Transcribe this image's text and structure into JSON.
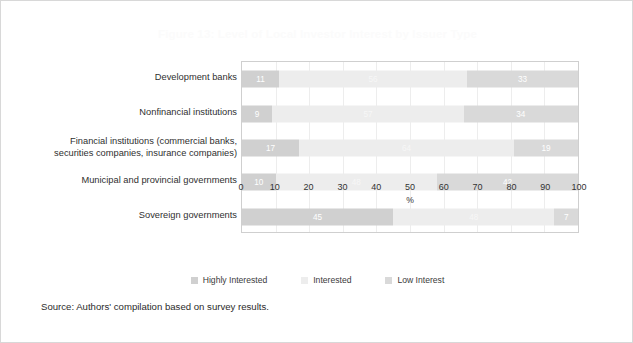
{
  "chart_data": {
    "type": "bar",
    "subtype": "stacked-horizontal-100pct",
    "title": "Figure 13: Level of Local Investor Interest by Issuer Type",
    "xlabel": "%",
    "ylabel": "",
    "xlim": [
      0,
      100
    ],
    "xticks": [
      "0",
      "10",
      "20",
      "30",
      "40",
      "50",
      "60",
      "70",
      "80",
      "90",
      "100"
    ],
    "grid": true,
    "legend_position": "bottom-center",
    "categories": [
      "Development banks",
      "Nonfinancial institutions",
      "Financial institutions (commercial banks, securities companies, insurance companies)",
      "Municipal and provincial governments",
      "Sovereign governments"
    ],
    "series": [
      {
        "name": "Highly Interested",
        "color": "#d0d0d0",
        "values": [
          11,
          9,
          17,
          10,
          45
        ]
      },
      {
        "name": "Interested",
        "color": "#ededed",
        "values": [
          56,
          57,
          64,
          48,
          48
        ]
      },
      {
        "name": "Low Interest",
        "color": "#d9d9d9",
        "values": [
          33,
          34,
          19,
          42,
          7
        ]
      }
    ]
  },
  "source": {
    "note": "Source: Authors' compilation based on survey results."
  }
}
